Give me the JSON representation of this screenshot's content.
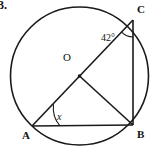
{
  "figure": {
    "problem_number": "3.",
    "type": "circle-geometry-diagram",
    "stroke_color": "#1a1a1a",
    "background_color": "#ffffff"
  },
  "labels": {
    "center": "O",
    "vertex_a": "A",
    "vertex_b": "B",
    "vertex_c": "C",
    "angle_at_c": "42°",
    "angle_at_a": "x"
  },
  "geometry": {
    "circle": {
      "cx": 79.5,
      "cy": 76,
      "r": 69
    },
    "points": {
      "A": {
        "x": 32,
        "y": 126
      },
      "B": {
        "x": 133,
        "y": 125
      },
      "C": {
        "x": 133,
        "y": 20
      },
      "O": {
        "x": 79.5,
        "y": 76
      }
    },
    "segments": [
      {
        "name": "AB",
        "from": "A",
        "to": "B"
      },
      {
        "name": "AC",
        "from": "A",
        "to": "C"
      },
      {
        "name": "BC",
        "from": "B",
        "to": "C"
      },
      {
        "name": "OB",
        "from": "O",
        "to": "B"
      }
    ],
    "angle_marks": [
      {
        "name": "angle-c-arc",
        "vertex": "C",
        "value": "42°"
      },
      {
        "name": "angle-a-arc",
        "vertex": "A",
        "value": "x"
      }
    ]
  }
}
